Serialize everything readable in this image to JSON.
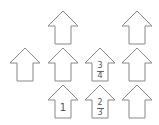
{
  "diagram": {
    "stroke_color": "#888888",
    "houses": [
      {
        "id": "r1c2",
        "row": 1,
        "col": 2,
        "x": 48,
        "y": 10,
        "content": ""
      },
      {
        "id": "r1c4",
        "row": 1,
        "col": 4,
        "x": 122,
        "y": 10,
        "content": ""
      },
      {
        "id": "r2c1",
        "row": 2,
        "col": 1,
        "x": 10,
        "y": 47,
        "content": ""
      },
      {
        "id": "r2c2",
        "row": 2,
        "col": 2,
        "x": 48,
        "y": 47,
        "content": ""
      },
      {
        "id": "r2c3",
        "row": 2,
        "col": 3,
        "x": 85,
        "y": 47,
        "content": "3/4",
        "numerator": "3",
        "denominator": "4"
      },
      {
        "id": "r2c4",
        "row": 2,
        "col": 4,
        "x": 122,
        "y": 47,
        "content": ""
      },
      {
        "id": "r3c2",
        "row": 3,
        "col": 2,
        "x": 48,
        "y": 84,
        "content": "1",
        "value": "1"
      },
      {
        "id": "r3c3",
        "row": 3,
        "col": 3,
        "x": 85,
        "y": 84,
        "content": "2/3",
        "numerator": "2",
        "denominator": "3"
      },
      {
        "id": "r3c4",
        "row": 3,
        "col": 4,
        "x": 122,
        "y": 84,
        "content": ""
      }
    ]
  }
}
